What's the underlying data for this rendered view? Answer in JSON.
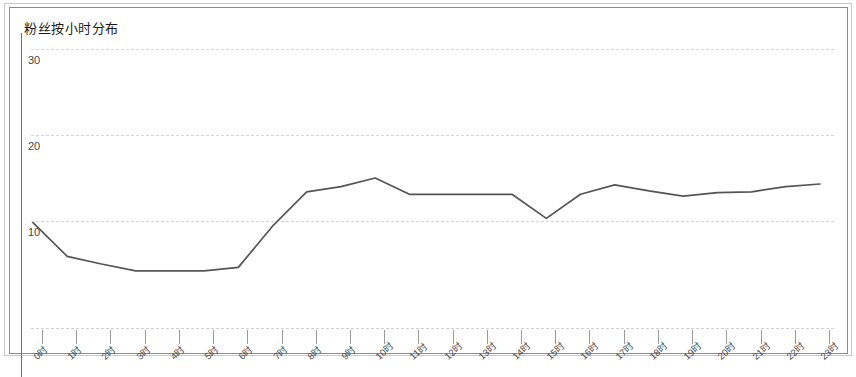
{
  "panel": {
    "title": "粉丝按小时分布"
  },
  "chart_data": {
    "type": "line",
    "title": "粉丝按小时分布",
    "xlabel": "",
    "ylabel": "",
    "grid": true,
    "legend": "none",
    "xlim": [
      0,
      23
    ],
    "ylim": [
      0,
      35
    ],
    "yticks": [
      10,
      20,
      30
    ],
    "ytick_labels": [
      "10",
      "20",
      "30"
    ],
    "categories": [
      "0时",
      "1时",
      "2时",
      "3时",
      "4时",
      "5时",
      "6时",
      "7时",
      "8时",
      "9时",
      "10时",
      "11时",
      "12时",
      "13时",
      "14时",
      "15时",
      "16时",
      "17时",
      "18时",
      "19时",
      "20时",
      "21时",
      "22时",
      "23时"
    ],
    "series": [
      {
        "name": "粉丝数",
        "color": "#555555",
        "values": [
          9.8,
          5.9,
          5.0,
          4.2,
          4.2,
          4.2,
          4.6,
          9.4,
          13.4,
          14.0,
          15.0,
          13.1,
          13.1,
          13.1,
          13.1,
          10.3,
          13.1,
          14.2,
          13.5,
          12.9,
          13.3,
          13.4,
          14.0,
          14.3
        ]
      }
    ]
  }
}
